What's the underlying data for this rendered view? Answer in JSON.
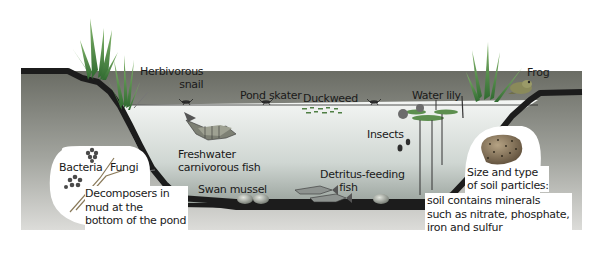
{
  "diagram": {
    "type": "pond-ecosystem-cross-section",
    "colors": {
      "background": "#ffffff",
      "soil_top": "#6e6e66",
      "soil_bottom": "#d9d9d6",
      "bank_edge": "#1e1e1e",
      "water_top": "#f2f4f2",
      "water_bottom": "#a9b0aa",
      "plant_green": "#3f7a3a",
      "plant_light": "#7fae6a",
      "callout_fill": "#ffffff"
    },
    "labels": {
      "herbivorous_snail": "Herbivorous\nsnail",
      "pond_skater": "Pond skater",
      "duckweed": "Duckweed",
      "water_lily": "Water lily",
      "frog": "Frog",
      "insects": "Insects",
      "freshwater_fish": "Freshwater\ncarnivorous fish",
      "swan_mussel": "Swan mussel",
      "detritus_fish": "Detritus-feeding\n      fish",
      "bacteria": "Bacteria",
      "fungi": "Fungi",
      "decomposers": "Decomposers in\nmud at the\nbottom of the pond",
      "soil_title": "Size and type\nof soil particles:",
      "soil_body": "soil contains minerals\nsuch as nitrate, phosphate,\niron and sulfur"
    },
    "organisms": [
      "Herbivorous snail",
      "Pond skater",
      "Duckweed",
      "Water lily",
      "Frog",
      "Insects",
      "Freshwater carnivorous fish",
      "Swan mussel",
      "Detritus-feeding fish",
      "Bacteria",
      "Fungi"
    ]
  }
}
